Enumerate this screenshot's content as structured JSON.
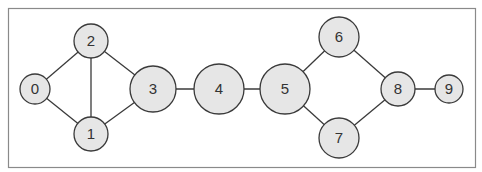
{
  "diagram": {
    "type": "undirected-graph",
    "frame": {
      "x": 8,
      "y": 8,
      "width": 467,
      "height": 159,
      "stroke": "#8a8a8a"
    },
    "style": {
      "node_fill": "#e6e6e6",
      "node_stroke": "#3a3a3a",
      "edge_stroke": "#3a3a3a",
      "label_color": "#333333"
    },
    "nodes": [
      {
        "id": "0",
        "label": "0",
        "x": 35,
        "y": 89,
        "r": 15
      },
      {
        "id": "1",
        "label": "1",
        "x": 91,
        "y": 134,
        "r": 17
      },
      {
        "id": "2",
        "label": "2",
        "x": 91,
        "y": 41,
        "r": 17
      },
      {
        "id": "3",
        "label": "3",
        "x": 153,
        "y": 89,
        "r": 23
      },
      {
        "id": "4",
        "label": "4",
        "x": 219,
        "y": 89,
        "r": 25
      },
      {
        "id": "5",
        "label": "5",
        "x": 285,
        "y": 89,
        "r": 25
      },
      {
        "id": "6",
        "label": "6",
        "x": 339,
        "y": 37,
        "r": 20
      },
      {
        "id": "7",
        "label": "7",
        "x": 339,
        "y": 138,
        "r": 20
      },
      {
        "id": "8",
        "label": "8",
        "x": 398,
        "y": 89,
        "r": 17
      },
      {
        "id": "9",
        "label": "9",
        "x": 449,
        "y": 89,
        "r": 14
      }
    ],
    "edges": [
      [
        "0",
        "2"
      ],
      [
        "0",
        "1"
      ],
      [
        "1",
        "2"
      ],
      [
        "2",
        "3"
      ],
      [
        "1",
        "3"
      ],
      [
        "3",
        "4"
      ],
      [
        "4",
        "5"
      ],
      [
        "5",
        "6"
      ],
      [
        "5",
        "7"
      ],
      [
        "6",
        "8"
      ],
      [
        "7",
        "8"
      ],
      [
        "8",
        "9"
      ]
    ]
  }
}
